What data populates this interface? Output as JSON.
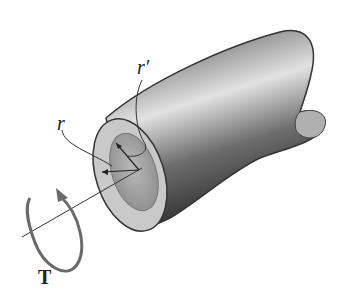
{
  "diagram": {
    "labels": {
      "inner_radius": "r",
      "outer_radius": "r′",
      "torque": "T"
    },
    "colors": {
      "shaft_dark": "#3a3a3a",
      "shaft_light": "#d8d8d8",
      "end_face": "#c4c4c4",
      "bore": "#a8a8a8",
      "torque_arrow": "#6a6a6a",
      "outline": "#333333"
    }
  }
}
